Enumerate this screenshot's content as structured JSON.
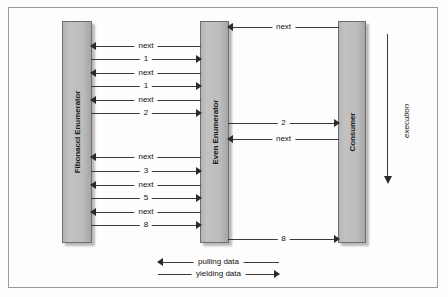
{
  "diagram": {
    "background_color": "#fdfdfd",
    "border_color": "#9a9a9a",
    "bar_fill_color": "#bdbdbd",
    "line_color": "#3a3a3a"
  },
  "lifelines": [
    {
      "id": "fibonacci",
      "label": "Fibonacci Enumerator"
    },
    {
      "id": "even",
      "label": "Even Enumerator"
    },
    {
      "id": "consumer",
      "label": "Consumer"
    }
  ],
  "messages": [
    {
      "label": "next",
      "direction": "left",
      "from": "consumer",
      "to": "even",
      "lane": "right"
    },
    {
      "label": "next",
      "direction": "left",
      "from": "even",
      "to": "fibonacci",
      "lane": "left"
    },
    {
      "label": "1",
      "direction": "right",
      "from": "fibonacci",
      "to": "even",
      "lane": "left"
    },
    {
      "label": "next",
      "direction": "left",
      "from": "even",
      "to": "fibonacci",
      "lane": "left"
    },
    {
      "label": "1",
      "direction": "right",
      "from": "fibonacci",
      "to": "even",
      "lane": "left"
    },
    {
      "label": "next",
      "direction": "left",
      "from": "even",
      "to": "fibonacci",
      "lane": "left"
    },
    {
      "label": "2",
      "direction": "right",
      "from": "fibonacci",
      "to": "even",
      "lane": "left"
    },
    {
      "label": "2",
      "direction": "right",
      "from": "even",
      "to": "consumer",
      "lane": "right"
    },
    {
      "label": "next",
      "direction": "left",
      "from": "consumer",
      "to": "even",
      "lane": "right"
    },
    {
      "label": "next",
      "direction": "left",
      "from": "even",
      "to": "fibonacci",
      "lane": "left"
    },
    {
      "label": "3",
      "direction": "right",
      "from": "fibonacci",
      "to": "even",
      "lane": "left"
    },
    {
      "label": "next",
      "direction": "left",
      "from": "even",
      "to": "fibonacci",
      "lane": "left"
    },
    {
      "label": "5",
      "direction": "right",
      "from": "fibonacci",
      "to": "even",
      "lane": "left"
    },
    {
      "label": "next",
      "direction": "left",
      "from": "even",
      "to": "fibonacci",
      "lane": "left"
    },
    {
      "label": "8",
      "direction": "right",
      "from": "fibonacci",
      "to": "even",
      "lane": "left"
    },
    {
      "label": "8",
      "direction": "right",
      "from": "even",
      "to": "consumer",
      "lane": "right"
    }
  ],
  "axis": {
    "label": "execution",
    "direction": "down"
  },
  "legend": [
    {
      "label": "pulling data",
      "direction": "left"
    },
    {
      "label": "yielding data",
      "direction": "right"
    }
  ]
}
